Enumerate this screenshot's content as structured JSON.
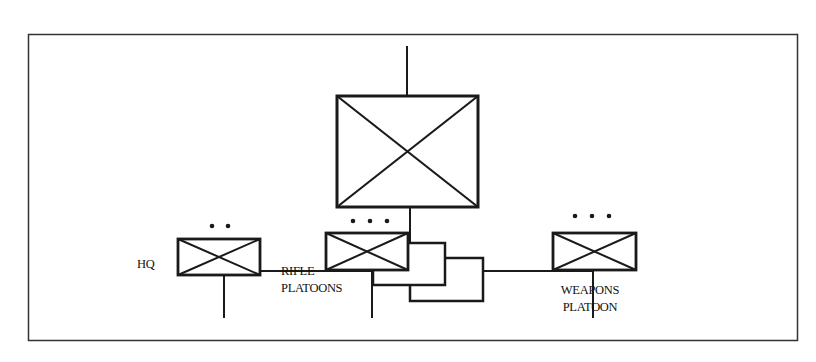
{
  "diagram": {
    "type": "military-organization-chart",
    "root": {
      "name": "company",
      "symbol": "infantry-x-box"
    },
    "children": [
      {
        "id": "hq",
        "label": "HQ",
        "echelon_dots": 2,
        "symbol": "infantry-x-box",
        "stacked": false
      },
      {
        "id": "rifle",
        "label_line1": "RIFLE",
        "label_line2": "PLATOONS",
        "echelon_dots": 3,
        "symbol": "infantry-x-box",
        "stacked": true,
        "stack_count": 3
      },
      {
        "id": "weapons",
        "label_line1": "WEAPONS",
        "label_line2": "PLATOON",
        "echelon_dots": 3,
        "symbol": "infantry-x-box",
        "stacked": false
      }
    ],
    "colors": {
      "line": "#1a1a1a",
      "background": "#ffffff",
      "frame": "#333333"
    }
  }
}
